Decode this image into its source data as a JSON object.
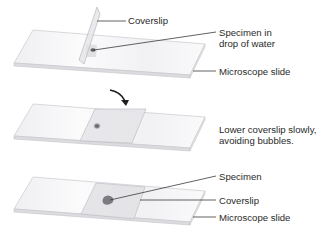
{
  "figure": {
    "steps": [
      {
        "step": 1,
        "labels": {
          "coverslip": "Coverslip",
          "specimen_line1": "Specimen in",
          "specimen_line2": "drop of water",
          "slide": "Microscope slide"
        }
      },
      {
        "step": 2,
        "instruction_line1": "Lower coverslip slowly,",
        "instruction_line2": "avoiding bubbles.",
        "arrow": "curved-arrow-down-right"
      },
      {
        "step": 3,
        "labels": {
          "specimen": "Specimen",
          "coverslip": "Coverslip",
          "slide": "Microscope slide"
        }
      }
    ]
  },
  "colors": {
    "slide_fill": "#f4f4f6",
    "slide_edge": "#c9c9cf",
    "coverslip_fill": "#e6e6ea",
    "specimen": "#8a8a8e",
    "leader_line": "#3a3a3a",
    "text": "#2a2a2a"
  }
}
